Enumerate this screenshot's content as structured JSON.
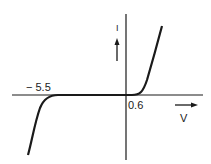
{
  "diagram": {
    "labels": {
      "reverse_breakdown": "− 5.5",
      "forward_threshold": "0.6",
      "x_axis": "V",
      "y_axis": "I"
    },
    "colors": {
      "ink": "#1a1a1a",
      "background": "#ffffff"
    }
  }
}
